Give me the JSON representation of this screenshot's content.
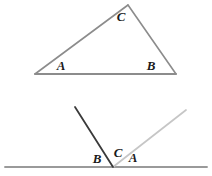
{
  "figure": {
    "background_color": "#ffffff",
    "colors": {
      "triangle_stroke": "#8c8c8c",
      "dark_ray_stroke": "#3a3a3a",
      "light_ray_stroke": "#c6c6c6",
      "baseline_stroke": "#9a9a9a",
      "label_color": "#1a1a1a"
    },
    "panels": [
      {
        "name": "triangle-panel",
        "shape": "triangle",
        "vertices": [
          {
            "label": "A",
            "x": 35,
            "y": 74,
            "label_x": 61,
            "label_y": 70
          },
          {
            "label": "B",
            "x": 176,
            "y": 74,
            "label_x": 151,
            "label_y": 70
          },
          {
            "label": "C",
            "x": 128,
            "y": 5,
            "label_x": 121,
            "label_y": 21
          }
        ],
        "edges": [
          {
            "name": "edge-AB",
            "from": "A",
            "to": "B"
          },
          {
            "name": "edge-AC",
            "from": "A",
            "to": "C"
          },
          {
            "name": "edge-CB",
            "from": "C",
            "to": "B"
          }
        ]
      },
      {
        "name": "angles-on-line-panel",
        "vertex": {
          "x": 113,
          "y": 167
        },
        "baseline": {
          "name": "straight-line",
          "x1": 5,
          "y1": 167,
          "x2": 207,
          "y2": 167
        },
        "rays": [
          {
            "name": "dark-ray",
            "x1": 113,
            "y1": 167,
            "x2": 75,
            "y2": 107,
            "color": "#3a3a3a"
          },
          {
            "name": "light-ray",
            "x1": 113,
            "y1": 167,
            "x2": 186,
            "y2": 110,
            "color": "#c6c6c6"
          }
        ],
        "labels": [
          {
            "label": "B",
            "x": 97,
            "y": 163
          },
          {
            "label": "C",
            "x": 118,
            "y": 157
          },
          {
            "label": "A",
            "x": 133,
            "y": 162
          }
        ]
      }
    ]
  }
}
